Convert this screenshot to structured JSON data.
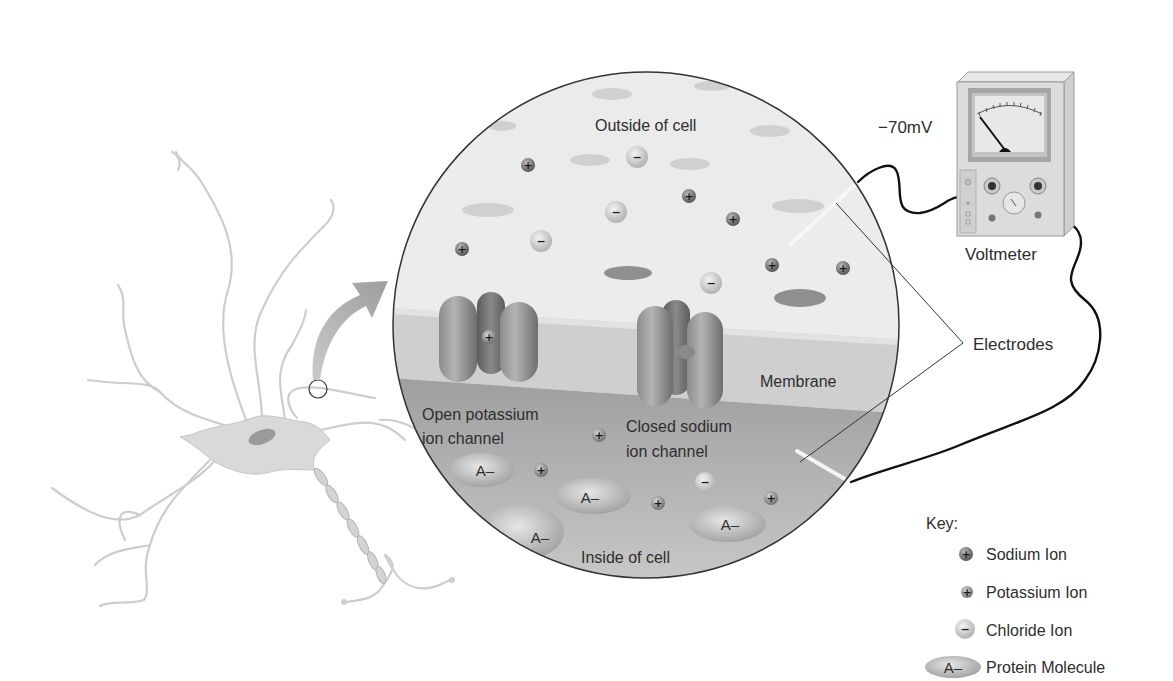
{
  "diagram": {
    "labels": {
      "outside": "Outside of cell",
      "inside": "Inside of cell",
      "membrane": "Membrane",
      "open_channel_line1": "Open potassium",
      "open_channel_line2": "ion channel",
      "closed_channel_line1": "Closed sodium",
      "closed_channel_line2": "ion channel",
      "electrodes": "Electrodes",
      "voltmeter": "Voltmeter",
      "voltage_reading": "−70mV"
    },
    "signs": {
      "plus": "+",
      "minus": "−",
      "protein": "A–"
    },
    "key": {
      "title": "Key:",
      "items": [
        {
          "label": "Sodium Ion",
          "symbol": "+",
          "icon": "sodium-ion-icon",
          "color": "#6f6f6f"
        },
        {
          "label": "Potassium Ion",
          "symbol": "+",
          "icon": "potassium-ion-icon",
          "color": "#8a8a8a"
        },
        {
          "label": "Chloride Ion",
          "symbol": "−",
          "icon": "chloride-ion-icon",
          "color": "#c9c9c9"
        },
        {
          "label": "Protein Molecule",
          "symbol": "A–",
          "icon": "protein-molecule-icon",
          "color": "#bdbdbd"
        }
      ]
    },
    "colors": {
      "outside_fluid": "#ececec",
      "membrane": "#cfcfcf",
      "inside_fluid": "#a9a9a9",
      "neuron": "#d6d6d6",
      "wire": "#111111",
      "arrow": "#b5b5b5"
    }
  }
}
